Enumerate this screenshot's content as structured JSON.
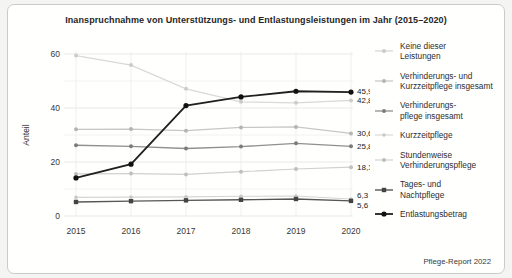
{
  "chart_data": {
    "type": "line",
    "title": "Inanspruchnahme von Unterstützungs- und Entlastungsleistungen im Jahr (2015–2020)",
    "ylabel": "Anteil",
    "xlabel": "",
    "x": [
      "2015",
      "2016",
      "2017",
      "2018",
      "2019",
      "2020"
    ],
    "ylim": [
      0,
      62
    ],
    "yticks": [
      0,
      20,
      40,
      60
    ],
    "minor_gridlines": [
      10,
      30,
      50
    ],
    "grid": true,
    "legend_position": "right",
    "source": "Pflege-Report 2022",
    "series": [
      {
        "name": "Keine dieser Leistungen",
        "label_lines": [
          "Keine dieser",
          "Leistungen"
        ],
        "values": [
          59.4,
          55.9,
          47.1,
          42.3,
          41.9,
          42.8
        ],
        "end_label": "42,8",
        "color": "#d9d9d7",
        "marker_color": "#cbcbc9",
        "marker": "circle",
        "line_width": 1.3,
        "marker_size": 2,
        "label_dy": 0
      },
      {
        "name": "Verhinderungs- und Kurzzeitpflege insgesamt",
        "label_lines": [
          "Verhinderungs- und",
          "Kurzzeitpflege insgesamt"
        ],
        "values": [
          32.1,
          32.2,
          31.6,
          32.8,
          33.0,
          30.6
        ],
        "end_label": "30,6",
        "color": "#c7c7c5",
        "marker_color": "#b4b4b2",
        "marker": "circle",
        "line_width": 1.3,
        "marker_size": 2,
        "label_dy": 0
      },
      {
        "name": "Verhinderungspflege insgesamt",
        "label_lines": [
          "Verhinderungs-",
          "pflege insgesamt"
        ],
        "values": [
          26.2,
          25.8,
          25.0,
          25.7,
          26.9,
          25.8
        ],
        "end_label": "25,8",
        "color": "#90908e",
        "marker_color": "#7c7c7a",
        "marker": "circle",
        "line_width": 1.3,
        "marker_size": 2,
        "label_dy": 0
      },
      {
        "name": "Kurzzeitpflege",
        "label_lines": [
          "Kurzzeitpflege"
        ],
        "values": [
          6.9,
          7.0,
          7.1,
          7.3,
          7.4,
          6.3
        ],
        "end_label": "6,3",
        "color": "#d5d5d3",
        "marker_color": "#c9c9c7",
        "marker": "circle",
        "line_width": 1.1,
        "marker_size": 1.8,
        "label_dy": -4
      },
      {
        "name": "Stundenweise Verhinderungspflege",
        "label_lines": [
          "Stundenweise",
          "Verhinderungspflege"
        ],
        "values": [
          15.6,
          15.7,
          15.4,
          16.4,
          17.4,
          18.1
        ],
        "end_label": "18,1",
        "color": "#d0d0ce",
        "marker_color": "#bfbfbd",
        "marker": "circle",
        "line_width": 1.2,
        "marker_size": 2,
        "label_dy": 0
      },
      {
        "name": "Tages- und Nachtpflege",
        "label_lines": [
          "Tages- und",
          "Nachtpflege"
        ],
        "values": [
          5.2,
          5.5,
          5.8,
          6.0,
          6.3,
          5.6
        ],
        "end_label": "5,6",
        "color": "#565654",
        "marker_color": "#434341",
        "marker": "square",
        "line_width": 1.4,
        "marker_size": 2.2,
        "label_dy": 4.5
      },
      {
        "name": "Entlastungsbetrag",
        "label_lines": [
          "Entlastungsbetrag"
        ],
        "values": [
          14.1,
          19.2,
          40.9,
          44.1,
          46.2,
          45.9
        ],
        "end_label": "45,9",
        "color": "#202020",
        "marker_color": "#111111",
        "marker": "circle",
        "line_width": 1.8,
        "marker_size": 2.6,
        "label_dy": -1
      }
    ]
  }
}
